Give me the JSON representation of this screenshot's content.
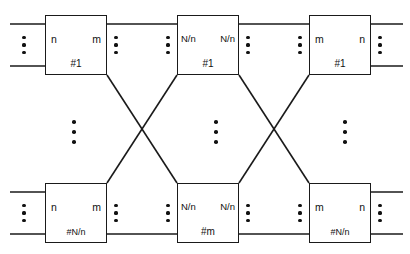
{
  "diagram": {
    "canvas": {
      "width": 410,
      "height": 254
    },
    "stroke_color": "#1a1a1a",
    "background_color": "#ffffff",
    "nodes": [
      {
        "key": "s1_1",
        "x": 45,
        "y": 15,
        "left_port": "n",
        "right_port": "m",
        "id_label": "#1",
        "stage": "input",
        "row": "top"
      },
      {
        "key": "s2_1",
        "x": 177,
        "y": 15,
        "left_port": "N/n",
        "right_port": "N/n",
        "id_label": "#1",
        "stage": "middle",
        "row": "top"
      },
      {
        "key": "s3_1",
        "x": 309,
        "y": 15,
        "left_port": "m",
        "right_port": "n",
        "id_label": "#1",
        "stage": "output",
        "row": "top"
      },
      {
        "key": "s1_k",
        "x": 45,
        "y": 183,
        "left_port": "n",
        "right_port": "m",
        "id_label": "#N/n",
        "stage": "input",
        "row": "bottom"
      },
      {
        "key": "s2_m",
        "x": 177,
        "y": 183,
        "left_port": "N/n",
        "right_port": "N/n",
        "id_label": "#m",
        "stage": "middle",
        "row": "bottom"
      },
      {
        "key": "s3_k",
        "x": 309,
        "y": 183,
        "left_port": "m",
        "right_port": "n",
        "id_label": "#N/n",
        "stage": "output",
        "row": "bottom"
      }
    ],
    "external_lines": [
      {
        "key": "in-top-upper",
        "x1": 10,
        "y1": 24,
        "x2": 45,
        "y2": 24
      },
      {
        "key": "in-top-lower",
        "x1": 10,
        "y1": 66,
        "x2": 45,
        "y2": 66
      },
      {
        "key": "in-bottom-upper",
        "x1": 10,
        "y1": 192,
        "x2": 45,
        "y2": 192
      },
      {
        "key": "in-bottom-lower",
        "x1": 10,
        "y1": 234,
        "x2": 45,
        "y2": 234
      },
      {
        "key": "out-top-upper",
        "x1": 371,
        "y1": 24,
        "x2": 403,
        "y2": 24
      },
      {
        "key": "out-top-lower",
        "x1": 371,
        "y1": 66,
        "x2": 403,
        "y2": 66
      },
      {
        "key": "out-bottom-upper",
        "x1": 371,
        "y1": 192,
        "x2": 403,
        "y2": 192
      },
      {
        "key": "out-bottom-lower",
        "x1": 371,
        "y1": 234,
        "x2": 403,
        "y2": 234
      }
    ],
    "straight_links": [
      {
        "key": "s1_1-to-s2_1",
        "x1": 107,
        "y1": 24,
        "x2": 177,
        "y2": 24
      },
      {
        "key": "s2_1-to-s3_1",
        "x1": 239,
        "y1": 24,
        "x2": 309,
        "y2": 24
      },
      {
        "key": "s1_k-to-s2_m",
        "x1": 107,
        "y1": 234,
        "x2": 177,
        "y2": 234
      },
      {
        "key": "s2_m-to-s3_k",
        "x1": 239,
        "y1": 234,
        "x2": 309,
        "y2": 234
      }
    ],
    "cross_links": [
      {
        "key": "s1_1-to-s2_m",
        "x1": 107,
        "y1": 75,
        "x2": 177,
        "y2": 183
      },
      {
        "key": "s1_k-to-s2_1",
        "x1": 107,
        "y1": 183,
        "x2": 177,
        "y2": 75
      },
      {
        "key": "s2_1-to-s3_k",
        "x1": 239,
        "y1": 75,
        "x2": 309,
        "y2": 183
      },
      {
        "key": "s2_m-to-s3_1",
        "x1": 239,
        "y1": 183,
        "x2": 309,
        "y2": 75
      }
    ],
    "port_ellipses": [
      {
        "key": "in-top-left",
        "x": 22,
        "y": 36
      },
      {
        "key": "link-top-a",
        "x": 114,
        "y": 36
      },
      {
        "key": "link-top-b",
        "x": 166,
        "y": 36
      },
      {
        "key": "link-top-c",
        "x": 246,
        "y": 36
      },
      {
        "key": "link-top-d",
        "x": 298,
        "y": 36
      },
      {
        "key": "out-top-right",
        "x": 378,
        "y": 36
      },
      {
        "key": "in-bottom-left",
        "x": 22,
        "y": 204
      },
      {
        "key": "link-bottom-a",
        "x": 114,
        "y": 204
      },
      {
        "key": "link-bottom-b",
        "x": 166,
        "y": 204
      },
      {
        "key": "link-bottom-c",
        "x": 246,
        "y": 204
      },
      {
        "key": "link-bottom-d",
        "x": 298,
        "y": 204
      },
      {
        "key": "out-bottom-right",
        "x": 378,
        "y": 204
      }
    ],
    "stage_ellipses": [
      {
        "key": "stage1-vertical",
        "x": 72,
        "y": 120
      },
      {
        "key": "stage2-vertical",
        "x": 214,
        "y": 120
      },
      {
        "key": "stage3-vertical",
        "x": 343,
        "y": 120
      }
    ]
  }
}
